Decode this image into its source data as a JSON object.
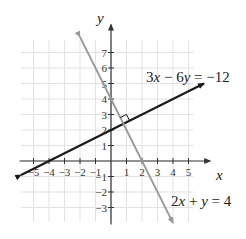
{
  "chart_data": {
    "type": "line",
    "title": "",
    "xlabel": "x",
    "ylabel": "y",
    "xlim": [
      -6,
      6
    ],
    "ylim": [
      -4,
      8
    ],
    "grid": true,
    "x_ticks": [
      -5,
      -4,
      -3,
      -2,
      -1,
      1,
      2,
      3,
      4,
      5
    ],
    "y_ticks": [
      -3,
      -2,
      -1,
      1,
      2,
      3,
      4,
      5,
      6,
      7
    ],
    "x_tick_labels": [
      "−5",
      "−4",
      "−3",
      "−2",
      "−1",
      "1",
      "2",
      "3",
      "4",
      "5"
    ],
    "y_tick_labels": [
      "−3",
      "−2",
      "−1",
      "1",
      "2",
      "3",
      "4",
      "5",
      "6",
      "7"
    ],
    "series": [
      {
        "name": "3x − 6y = −12",
        "equation": "3x - 6y = -12",
        "slope": 0.5,
        "y_intercept": 2,
        "x_intercept": -4,
        "color": "#1a1a1a",
        "points": [
          [
            -5.8,
            -0.9
          ],
          [
            6,
            5
          ]
        ]
      },
      {
        "name": "2x + y = 4",
        "equation": "2x + y = 4",
        "slope": -2,
        "y_intercept": 4,
        "x_intercept": 2,
        "color": "#999999",
        "points": [
          [
            -2,
            8
          ],
          [
            4,
            -4
          ]
        ]
      }
    ],
    "annotations": [
      {
        "type": "right-angle-marker",
        "at": [
          0.8,
          2.4
        ],
        "label": "perpendicular"
      }
    ]
  },
  "labels": {
    "x_axis": "x",
    "y_axis": "y",
    "line1_prefix": "3",
    "line1_var1": "x",
    "line1_mid": " − 6",
    "line1_var2": "y",
    "line1_suffix": " = −12",
    "line2_prefix": "2",
    "line2_var1": "x",
    "line2_mid": " + ",
    "line2_var2": "y",
    "line2_suffix": " = 4"
  }
}
